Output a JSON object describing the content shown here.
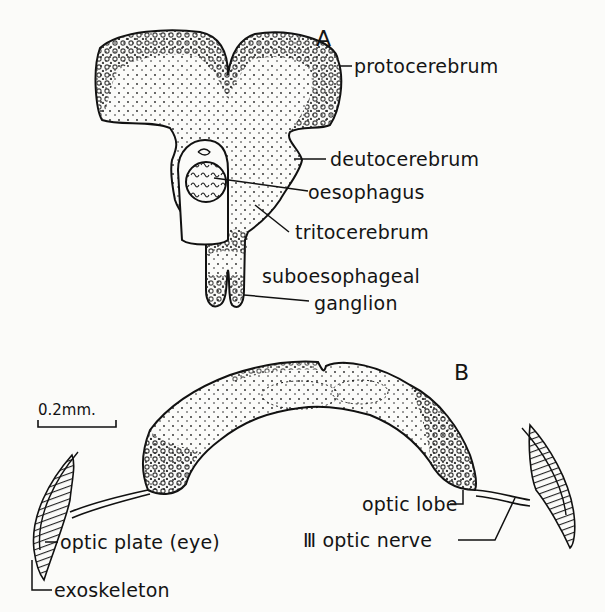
{
  "figure": {
    "panels": [
      {
        "id": "A",
        "label": "A",
        "callouts": [
          {
            "key": "protocerebrum",
            "text": "protocerebrum"
          },
          {
            "key": "deutocerebrum",
            "text": "deutocerebrum"
          },
          {
            "key": "oesophagus",
            "text": "oesophagus"
          },
          {
            "key": "tritocerebrum",
            "text": "tritocerebrum"
          },
          {
            "key": "suboesophageal_ganglion",
            "text_line1": "suboesophageal",
            "text_line2": "ganglion"
          }
        ]
      },
      {
        "id": "B",
        "label": "B",
        "scale_bar": "0.2mm.",
        "callouts": [
          {
            "key": "optic_lobe",
            "text": "optic lobe"
          },
          {
            "key": "optic_nerve",
            "text": "Ⅲ optic nerve"
          },
          {
            "key": "optic_plate",
            "text": "optic plate (eye)"
          },
          {
            "key": "exoskeleton",
            "text": "exoskeleton"
          }
        ]
      }
    ]
  },
  "colors": {
    "ink": "#141414",
    "paper": "#fbfbf9"
  }
}
